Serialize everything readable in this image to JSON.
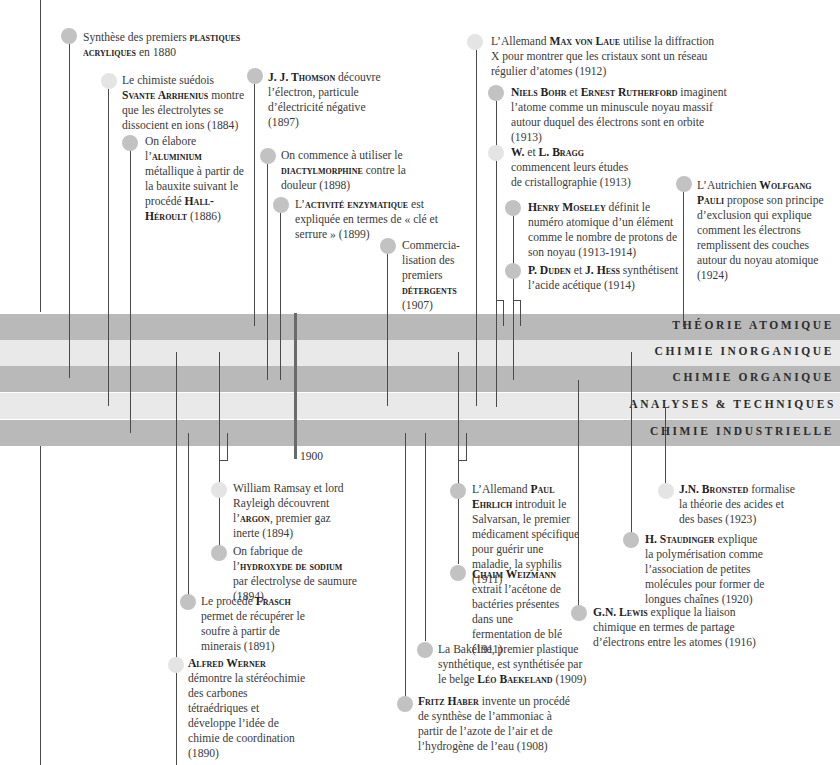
{
  "bands": [
    {
      "label": "THÉORIE ATOMIQUE",
      "tone": "dark"
    },
    {
      "label": "CHIMIE INORGANIQUE",
      "tone": "light"
    },
    {
      "label": "CHIMIE ORGANIQUE",
      "tone": "dark"
    },
    {
      "label": "ANALYSES & TECHNIQUES",
      "tone": "light"
    },
    {
      "label": "CHIMIE INDUSTRIELLE",
      "tone": "dark"
    }
  ],
  "year_marker": "1900",
  "colors": {
    "band_dark": "#b9b9b9",
    "band_light": "#e9e9e9",
    "dot": "#c2c2c2",
    "dot_pale": "#e4e4e4",
    "line": "#4a4a4a"
  },
  "events_top": [
    {
      "pre": "Synthèse des premiers ",
      "bold": "plastiques acryliques",
      "post": " en 1880"
    },
    {
      "pre": "Le chimiste suédois ",
      "bold": "Svante Arrhenius",
      "post": " montre que les électrolytes se dissocient en ions (1884)"
    },
    {
      "pre": "On élabore l’",
      "bold": "aluminium",
      "post": " métallique à partir de la bauxite suivant le procédé ",
      "bold2": "Hall-Héroult",
      "post2": " (1886)"
    },
    {
      "pre": "",
      "bold": "J. J. Thomson",
      "post": " découvre l’électron, particule d’électricité négative (1897)"
    },
    {
      "pre": "On commence à utiliser le ",
      "bold": "diactylmorphine",
      "post": " contre la douleur (1898)"
    },
    {
      "pre": "L’",
      "bold": "activité enzymatique",
      "post": " est expliquée en termes de « clé et serrure » (1899)"
    },
    {
      "pre": "Commercia-lisation des premiers ",
      "bold": "détergents",
      "post": " (1907)"
    },
    {
      "pre": "L’Allemand ",
      "bold": "Max von Laue",
      "post": " utilise la diffraction X pour montrer que les cristaux sont un réseau régulier d’atomes (1912)"
    },
    {
      "pre": "",
      "bold": "Niels Bohr",
      "mid": " et ",
      "bold2": "Ernest Rutherford",
      "post2": " imaginent l’atome comme un minuscule noyau massif autour duquel des électrons sont en orbite (1913)"
    },
    {
      "pre": "",
      "bold": "W.",
      "mid": " et ",
      "bold2": "L. Bragg",
      "post2": " commencent leurs études de cristallographie (1913)"
    },
    {
      "pre": "",
      "bold": "Henry Moseley",
      "post": " définit le numéro atomique d’un élément comme le nombre de protons de son noyau (1913-1914)"
    },
    {
      "pre": "",
      "bold": "P. Duden",
      "mid": " et ",
      "bold2": "J. Hess",
      "post2": " synthétisent l’acide acétique (1914)"
    },
    {
      "pre": "L’Autrichien ",
      "bold": "Wolfgang Pauli",
      "post": " propose son principe d’exclusion qui explique comment les électrons remplissent des couches autour du noyau atomique (1924)"
    }
  ],
  "events_bottom": [
    {
      "pre": "William Ramsay et lord Rayleigh découvrent l’",
      "bold": "argon",
      "post": ", premier gaz inerte (1894)"
    },
    {
      "pre": "On fabrique de l’",
      "bold": "hydroxyde de sodium",
      "post": " par électrolyse de saumure (1894)."
    },
    {
      "pre": "Le procédé ",
      "bold": "Frasch",
      "post": " permet de récupérer le soufre à partir de minerais (1891)"
    },
    {
      "pre": "",
      "bold": "Alfred Werner",
      "post": " démontre la stéréochimie des carbones tétraédriques et développe l’idée de chimie de coordination (1890)"
    },
    {
      "pre": "L’Allemand ",
      "bold": "Paul Ehrlich",
      "post": " introduit le Salvarsan, le premier médicament spécifique pour guérir une maladie, la syphilis (1911)"
    },
    {
      "pre": "",
      "bold": "Chaim Weizmann",
      "post": " extrait l’acétone de bactéries présentes dans une fermentation de blé (1911)"
    },
    {
      "pre": "La Bakélite, premier plastique synthétique, est synthétisée par le belge ",
      "bold": "Léo Baekeland",
      "post": " (1909)"
    },
    {
      "pre": "",
      "bold": "Fritz Haber",
      "post": " invente un procédé de synthèse de l’ammoniac à partir de l’azote de l’air et de l’hydrogène de l’eau (1908)"
    },
    {
      "pre": "",
      "bold": "G.N. Lewis",
      "post": " explique la liaison chimique en termes de partage d’électrons entre les atomes (1916)"
    },
    {
      "pre": "",
      "bold": "H. Staudinger",
      "post": " explique la polymérisation comme l’association de petites molécules pour former de longues chaînes (1920)"
    },
    {
      "pre": "",
      "bold": "J.N. Bronsted",
      "post": " formalise la théorie des acides et des bases (1923)"
    }
  ]
}
